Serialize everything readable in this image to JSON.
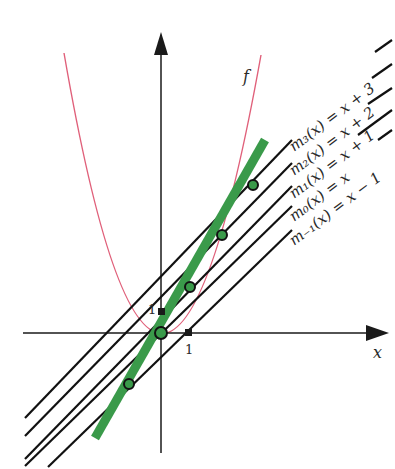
{
  "diagram": {
    "title": "",
    "axes": {
      "x_label": "x",
      "y_label": "",
      "x_tick_label": "1",
      "y_tick_label": "1"
    },
    "curve": {
      "label": "f",
      "equation": "f(x) = x^2",
      "color": "#e0607a"
    },
    "tangent_line": {
      "equation": "y = 2x",
      "color": "#3a9a4a"
    },
    "lines": [
      {
        "name": "m3",
        "label": "m₃(x) = x + 3",
        "k": 3
      },
      {
        "name": "m2",
        "label": "m₂(x) = x + 2",
        "k": 2
      },
      {
        "name": "m1",
        "label": "m₁(x) = x + 1",
        "k": 1
      },
      {
        "name": "m0",
        "label": "m₀(x) = x",
        "k": 0
      },
      {
        "name": "m-1",
        "label": "m₋₁(x) = x − 1",
        "k": -1
      }
    ],
    "intersection_points": [
      {
        "x": 3,
        "y": 6
      },
      {
        "x": 2,
        "y": 4
      },
      {
        "x": 1,
        "y": 2
      },
      {
        "x": 0,
        "y": 0
      },
      {
        "x": -1,
        "y": -2
      }
    ],
    "colors": {
      "axis": "#1a1a1a",
      "line": "#111111",
      "point_fill": "#3a9a4a",
      "point_stroke": "#111111"
    }
  }
}
